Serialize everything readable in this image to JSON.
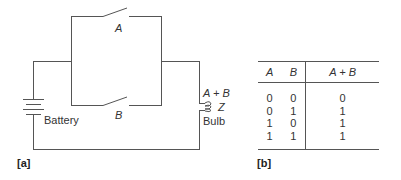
{
  "figure": {
    "panel_a": {
      "caption": "[a]",
      "switch_a_label": "A",
      "switch_b_label": "B",
      "battery_label": "Battery",
      "bulb_expression": "A + B",
      "bulb_output_label": "Z",
      "bulb_label": "Bulb"
    },
    "panel_b": {
      "caption": "[b]",
      "headers": [
        "A",
        "B",
        "A + B"
      ],
      "rows": [
        [
          "0",
          "0",
          "0"
        ],
        [
          "0",
          "1",
          "1"
        ],
        [
          "1",
          "0",
          "1"
        ],
        [
          "1",
          "1",
          "1"
        ]
      ]
    }
  }
}
